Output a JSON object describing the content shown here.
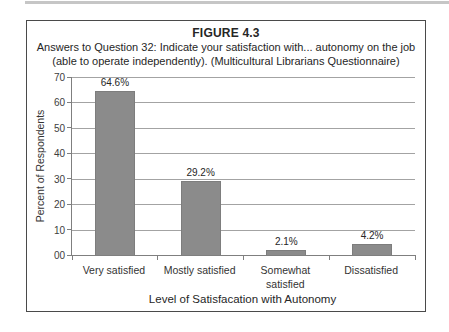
{
  "figure": {
    "label": "FIGURE 4.3",
    "caption": "Answers to Question 32: Indicate your satisfaction with... autonomy on the job (able to operate independently). (Multicultural Librarians Questionnaire)"
  },
  "chart_data": {
    "type": "bar",
    "title": "FIGURE 4.3",
    "categories": [
      "Very satisfied",
      "Mostly satisfied",
      "Somewhat satisfied",
      "Dissatisfied"
    ],
    "values": [
      64.6,
      29.2,
      2.1,
      4.2
    ],
    "value_labels": [
      "64.6%",
      "29.2%",
      "2.1%",
      "4.2%"
    ],
    "xlabel": "Level of Satisfacation with Autonomy",
    "ylabel": "Percent of Respondents",
    "ylim": [
      0,
      70
    ],
    "ytick_labels": [
      "70",
      "60",
      "50",
      "40",
      "30",
      "20",
      "10",
      "00"
    ],
    "grid": true,
    "legend": "none",
    "bar_color": "#8b8b8b",
    "gridline_color": "#a3a3a3",
    "axis_color": "#7f7f7f"
  }
}
